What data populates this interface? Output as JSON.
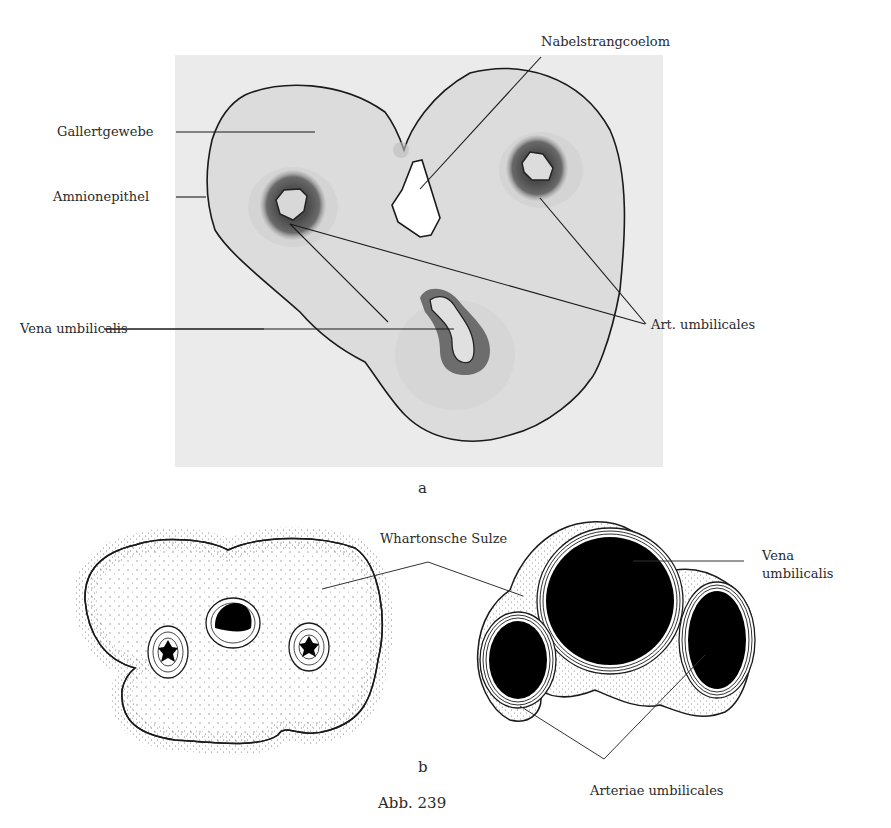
{
  "figure": {
    "caption": "Abb. 239",
    "panel_a": {
      "letter": "a",
      "labels": {
        "nabelstrangcoelom": "Nabelstrangcoelom",
        "gallertgewebe": "Gallertgewebe",
        "amnionepithel": "Amnionepithel",
        "vena_umbilicalis": "Vena umbilicalis",
        "art_umbilicales": "Art. umbilicales"
      }
    },
    "panel_b": {
      "letter": "b",
      "labels": {
        "whartonsche_sulze": "Whartonsche Sulze",
        "vena_line1": "Vena",
        "vena_line2": "umbilicalis",
        "arteriae_umbilicales": "Arteriae umbilicales"
      }
    }
  }
}
